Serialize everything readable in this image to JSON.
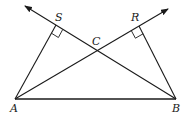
{
  "diagram": {
    "type": "geometry",
    "stroke_color": "#1a1a1a",
    "points": {
      "A": {
        "label": "A",
        "x": 15,
        "y": 99
      },
      "B": {
        "label": "B",
        "x": 176,
        "y": 99
      },
      "C": {
        "label": "C",
        "x": 97,
        "y": 50
      },
      "S": {
        "label": "S",
        "x": 56,
        "y": 25
      },
      "R": {
        "label": "R",
        "x": 139,
        "y": 26
      }
    },
    "segments": [
      {
        "from": "A",
        "to": "B"
      },
      {
        "from": "A",
        "to": "S"
      },
      {
        "from": "B",
        "to": "R"
      }
    ],
    "rays": [
      {
        "from": "B",
        "through": [
          "C",
          "S"
        ],
        "arrow_at": {
          "x": 25,
          "y": 6
        }
      },
      {
        "from": "A",
        "through": [
          "C",
          "R"
        ],
        "arrow_at": {
          "x": 168,
          "y": 9
        }
      }
    ],
    "right_angles": [
      "S",
      "R"
    ],
    "labels": {
      "A": "A",
      "B": "B",
      "C": "C",
      "S": "S",
      "R": "R"
    }
  }
}
